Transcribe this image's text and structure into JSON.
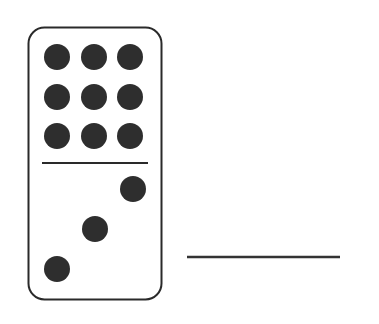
{
  "domino": {
    "top_value": 9,
    "bottom_value": 3,
    "pip_color": "#2e2e2e",
    "outline_color": "#2a2a2a"
  },
  "answer_line": {
    "value": ""
  }
}
